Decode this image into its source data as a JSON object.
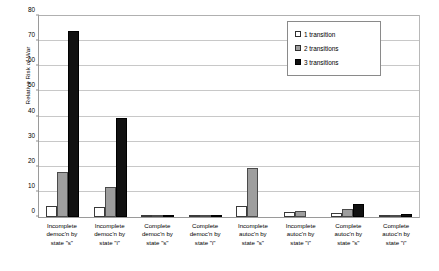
{
  "chart_data": {
    "type": "bar",
    "title": "",
    "xlabel": "",
    "ylabel": "Relative Risk of War",
    "ylim": [
      0,
      80
    ],
    "ytick_step": 10,
    "yticks": [
      0,
      10,
      20,
      30,
      40,
      50,
      60,
      70,
      80
    ],
    "ytick_labels": [
      "0",
      "10",
      "20",
      "30",
      "40",
      "50",
      "60",
      "70",
      "80"
    ],
    "grid": "horizontal",
    "legend_position": "upper-right",
    "categories": [
      "Incomplete democ'n by state \"s\"",
      "Incomplete democ'n by state \"i\"",
      "Complete democ'n by state \"s\"",
      "Complete democ'n by state \"i\"",
      "Incomplete autoc'n by state \"s\"",
      "Incomplete autoc'n by state \"i\"",
      "Complete autoc'n by state \"s\"",
      "Complete autoc'n by state \"i\""
    ],
    "category_lines": [
      [
        "Incomplete",
        "democ'n by",
        "state \"s\""
      ],
      [
        "Incomplete",
        "democ'n by",
        "state \"i\""
      ],
      [
        "Complete",
        "democ'n by",
        "state \"s\""
      ],
      [
        "Complete",
        "democ'n by",
        "state \"i\""
      ],
      [
        "Incomplete",
        "autoc'n by",
        "state \"s\""
      ],
      [
        "Incomplete",
        "autoc'n by",
        "state \"i\""
      ],
      [
        "Complete",
        "autoc'n by",
        "state \"s\""
      ],
      [
        "Complete",
        "autoc'n by",
        "state \"i\""
      ]
    ],
    "series": [
      {
        "name": "1 transition",
        "color": "#ffffff",
        "values": [
          4.2,
          4.0,
          0.8,
          0.4,
          4.2,
          1.8,
          1.6,
          0.5
        ]
      },
      {
        "name": "2 transitions",
        "color": "#9e9e9e",
        "values": [
          18.0,
          12.0,
          1.0,
          0.5,
          19.5,
          2.5,
          3.0,
          0.7
        ]
      },
      {
        "name": "3 transitions",
        "color": "#111111",
        "values": [
          74.0,
          39.5,
          0.6,
          0.3,
          0.0,
          0.0,
          5.0,
          1.2
        ]
      }
    ]
  },
  "legend": {
    "items": [
      {
        "label": "1 transition"
      },
      {
        "label": "2 transitions"
      },
      {
        "label": "3 transitions"
      }
    ]
  },
  "axis": {
    "y_title": "Relative Risk of War"
  }
}
